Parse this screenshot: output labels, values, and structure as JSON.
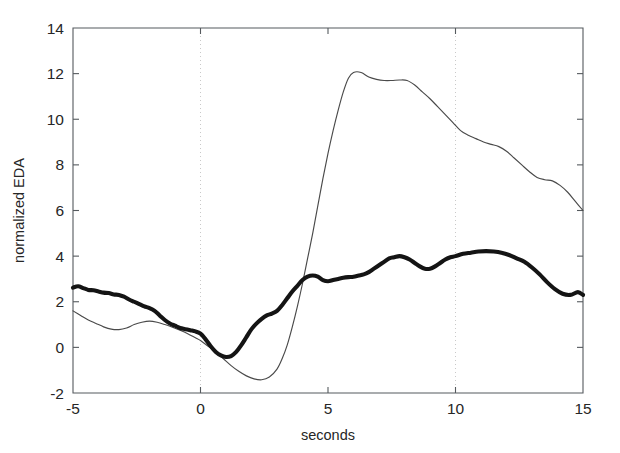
{
  "chart_data": {
    "type": "line",
    "title": "",
    "xlabel": "seconds",
    "ylabel": "normalized EDA",
    "xlim": [
      -5,
      15
    ],
    "ylim": [
      -2,
      14
    ],
    "xticks": [
      -5,
      0,
      5,
      10,
      15
    ],
    "xtick_labels": [
      "-5",
      "0",
      "5",
      "10",
      "15"
    ],
    "yticks": [
      -2,
      0,
      2,
      4,
      6,
      8,
      10,
      12,
      14
    ],
    "ytick_labels": [
      "-2",
      "0",
      "2",
      "4",
      "6",
      "8",
      "10",
      "12",
      "14"
    ],
    "grid": false,
    "vertical_markers": [
      0,
      10
    ],
    "vertical_marker_style": "dotted",
    "legend": null,
    "legend_position": "none",
    "series": [
      {
        "name": "thin-trace",
        "style": "thin-line",
        "color": "#4a4a4a",
        "linewidth": 1,
        "x": [
          -5.0,
          -4.7,
          -4.4,
          -4.1,
          -3.8,
          -3.5,
          -3.2,
          -2.9,
          -2.6,
          -2.3,
          -2.0,
          -1.7,
          -1.4,
          -1.1,
          -0.8,
          -0.5,
          -0.2,
          0.0,
          0.3,
          0.6,
          0.9,
          1.2,
          1.5,
          1.8,
          2.1,
          2.4,
          2.7,
          3.0,
          3.2,
          3.4,
          3.6,
          3.8,
          4.0,
          4.2,
          4.4,
          4.6,
          4.8,
          5.0,
          5.2,
          5.4,
          5.6,
          5.8,
          6.0,
          6.3,
          6.6,
          6.9,
          7.2,
          7.5,
          7.8,
          8.1,
          8.4,
          8.7,
          9.0,
          9.3,
          9.6,
          9.9,
          10.2,
          10.5,
          10.8,
          11.1,
          11.4,
          11.7,
          12.0,
          12.3,
          12.6,
          12.9,
          13.2,
          13.5,
          13.8,
          14.1,
          14.4,
          14.7,
          15.0
        ],
        "y": [
          1.6,
          1.4,
          1.2,
          1.05,
          0.9,
          0.8,
          0.78,
          0.85,
          1.0,
          1.1,
          1.15,
          1.1,
          1.0,
          0.88,
          0.75,
          0.6,
          0.42,
          0.3,
          0.05,
          -0.2,
          -0.5,
          -0.8,
          -1.05,
          -1.25,
          -1.38,
          -1.42,
          -1.3,
          -0.95,
          -0.5,
          0.1,
          0.9,
          1.8,
          2.8,
          3.9,
          5.0,
          6.2,
          7.4,
          8.5,
          9.5,
          10.4,
          11.2,
          11.8,
          12.05,
          12.05,
          11.85,
          11.75,
          11.7,
          11.7,
          11.72,
          11.7,
          11.5,
          11.2,
          10.9,
          10.55,
          10.2,
          9.85,
          9.5,
          9.3,
          9.15,
          9.0,
          8.9,
          8.8,
          8.6,
          8.3,
          8.0,
          7.7,
          7.45,
          7.35,
          7.3,
          7.1,
          6.8,
          6.4,
          6.0
        ]
      },
      {
        "name": "thick-trace",
        "style": "thick-line",
        "color": "#141414",
        "linewidth": 4,
        "x": [
          -5.0,
          -4.8,
          -4.6,
          -4.4,
          -4.2,
          -4.0,
          -3.8,
          -3.6,
          -3.4,
          -3.2,
          -3.0,
          -2.8,
          -2.6,
          -2.4,
          -2.2,
          -2.0,
          -1.8,
          -1.6,
          -1.4,
          -1.2,
          -1.0,
          -0.8,
          -0.6,
          -0.4,
          -0.2,
          0.0,
          0.2,
          0.4,
          0.6,
          0.8,
          1.0,
          1.2,
          1.4,
          1.6,
          1.8,
          2.0,
          2.2,
          2.4,
          2.6,
          2.8,
          3.0,
          3.2,
          3.4,
          3.6,
          3.8,
          4.0,
          4.2,
          4.4,
          4.6,
          4.8,
          5.0,
          5.2,
          5.4,
          5.6,
          5.8,
          6.0,
          6.2,
          6.4,
          6.6,
          6.8,
          7.0,
          7.2,
          7.4,
          7.6,
          7.8,
          8.0,
          8.2,
          8.4,
          8.6,
          8.8,
          9.0,
          9.2,
          9.4,
          9.6,
          9.8,
          10.0,
          10.3,
          10.6,
          10.9,
          11.2,
          11.5,
          11.8,
          12.1,
          12.4,
          12.7,
          13.0,
          13.3,
          13.6,
          13.9,
          14.2,
          14.5,
          14.8,
          15.0
        ],
        "y": [
          2.62,
          2.68,
          2.6,
          2.52,
          2.5,
          2.45,
          2.4,
          2.38,
          2.32,
          2.3,
          2.22,
          2.1,
          2.0,
          1.9,
          1.8,
          1.72,
          1.6,
          1.4,
          1.2,
          1.05,
          0.95,
          0.85,
          0.8,
          0.75,
          0.7,
          0.6,
          0.35,
          0.05,
          -0.2,
          -0.35,
          -0.42,
          -0.38,
          -0.2,
          0.1,
          0.45,
          0.8,
          1.05,
          1.25,
          1.4,
          1.48,
          1.6,
          1.85,
          2.15,
          2.45,
          2.7,
          2.95,
          3.1,
          3.15,
          3.1,
          2.95,
          2.9,
          2.95,
          3.0,
          3.05,
          3.08,
          3.1,
          3.15,
          3.2,
          3.3,
          3.45,
          3.6,
          3.75,
          3.9,
          3.95,
          4.0,
          3.95,
          3.85,
          3.7,
          3.55,
          3.45,
          3.45,
          3.55,
          3.7,
          3.85,
          3.95,
          4.0,
          4.1,
          4.15,
          4.2,
          4.22,
          4.2,
          4.15,
          4.05,
          3.9,
          3.75,
          3.5,
          3.2,
          2.85,
          2.55,
          2.35,
          2.3,
          2.42,
          2.3
        ]
      }
    ]
  },
  "figure": {
    "background_color": "#ffffff",
    "axis_color": "#555a5e",
    "marker_color": "#c9c9c9"
  }
}
